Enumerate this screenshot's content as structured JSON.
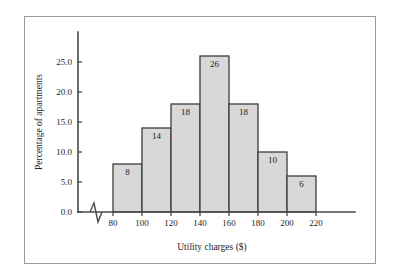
{
  "chart_data": {
    "type": "bar",
    "title": "",
    "subtitle": "",
    "xlabel": "Utility charges ($)",
    "ylabel": "Percentage of apartments",
    "categories": [
      "80-100",
      "100-120",
      "120-140",
      "140-160",
      "160-180",
      "180-200",
      "200-220"
    ],
    "bin_edges": [
      80,
      100,
      120,
      140,
      160,
      180,
      200,
      220
    ],
    "values": [
      8,
      14,
      18,
      26,
      18,
      10,
      6
    ],
    "bar_labels": [
      "8",
      "14",
      "18",
      "26",
      "18",
      "10",
      "6"
    ],
    "xticks": [
      80,
      100,
      120,
      140,
      160,
      180,
      200,
      220
    ],
    "xtick_labels": [
      "80",
      "100",
      "120",
      "140",
      "160",
      "180",
      "200",
      "220"
    ],
    "yticks": [
      0.0,
      5.0,
      10.0,
      15.0,
      20.0,
      25.0
    ],
    "ytick_labels": [
      "0.0",
      "5.0",
      "10.0",
      "15.0",
      "20.0",
      "25.0"
    ],
    "ylim": [
      0,
      28
    ],
    "xlim": [
      80,
      220
    ],
    "grid": false,
    "legend": false,
    "x_axis_break": true,
    "bar_fill_color": "#d8d8d8",
    "bar_edge_color": "#3c3c3c",
    "axis_color": "#4a4a4a",
    "frame_color": "#9a9a9a",
    "background_color": "#ffffff",
    "text_color": "#1e1e1e"
  }
}
